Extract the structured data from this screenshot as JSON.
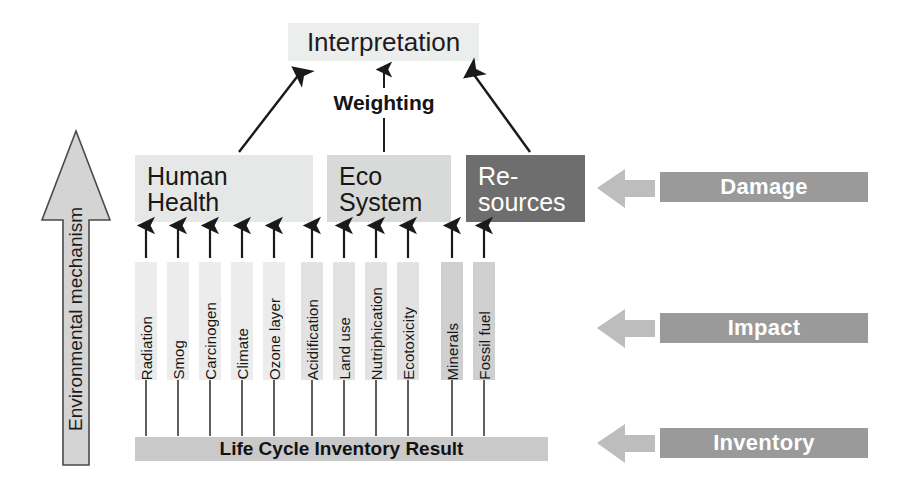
{
  "diagram": {
    "title_box": {
      "label": "Interpretation"
    },
    "weighting": {
      "label": "Weighting"
    },
    "environmental_mechanism": {
      "label": "Environmental mechanism"
    },
    "inventory_bar": {
      "label": "Life Cycle Inventory Result"
    },
    "damage_categories": [
      {
        "name": "human-health",
        "line1": "Human",
        "line2": "Health",
        "fill": "#e6e7e7",
        "text_color": "#181818"
      },
      {
        "name": "eco-system",
        "line1": "Eco",
        "line2": "System",
        "fill": "#d8d9d9",
        "text_color": "#181818"
      },
      {
        "name": "resources",
        "line1": "Re-",
        "line2": "sources",
        "fill": "#6e6e6e",
        "text_color": "#ffffff"
      }
    ],
    "impact_categories": [
      {
        "label": "Radiation",
        "group": "human-health",
        "fill": "#ececec"
      },
      {
        "label": "Smog",
        "group": "human-health",
        "fill": "#ececec"
      },
      {
        "label": "Carcinogen",
        "group": "human-health",
        "fill": "#ececec"
      },
      {
        "label": "Climate",
        "group": "human-health",
        "fill": "#ececec"
      },
      {
        "label": "Ozone layer",
        "group": "human-health",
        "fill": "#ececec"
      },
      {
        "label": "Acidification",
        "group": "eco-system",
        "fill": "#e2e2e2"
      },
      {
        "label": "Land use",
        "group": "eco-system",
        "fill": "#e2e2e2"
      },
      {
        "label": "Nutriphication",
        "group": "eco-system",
        "fill": "#e2e2e2"
      },
      {
        "label": "Ecotoxicity",
        "group": "eco-system",
        "fill": "#e2e2e2"
      },
      {
        "label": "Minerals",
        "group": "resources",
        "fill": "#cfcfcf"
      },
      {
        "label": "Fossil fuel",
        "group": "resources",
        "fill": "#cfcfcf"
      }
    ],
    "stage_labels": [
      {
        "label": "Damage",
        "fill": "#9a9a9a",
        "text_color": "#ffffff"
      },
      {
        "label": "Impact",
        "fill": "#9a9a9a",
        "text_color": "#ffffff"
      },
      {
        "label": "Inventory",
        "fill": "#9a9a9a",
        "text_color": "#ffffff"
      }
    ],
    "colors": {
      "arrow_stroke": "#1a1a1a",
      "block_arrow_fill": "#bdbdbd",
      "env_arrow_fill": "#d4d4d4",
      "env_arrow_stroke": "#4a4a4a",
      "background": "#ffffff"
    }
  }
}
